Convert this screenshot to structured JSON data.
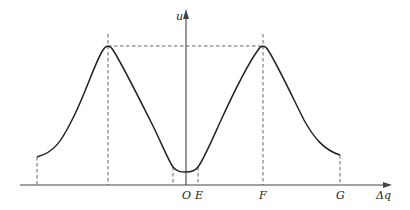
{
  "diagram": {
    "type": "curve-plot",
    "axes": {
      "y_label": "u",
      "x_label": "Δq"
    },
    "point_labels": [
      "O",
      "E",
      "F",
      "G"
    ],
    "colors": {
      "curve": "#222222",
      "axis": "#444444",
      "dashed": "#555555",
      "background": "#ffffff"
    },
    "features": {
      "peaks": 2,
      "minimum_at": "O",
      "dashed_verticals": 6,
      "dashed_horizontal": "connects the two peak maxima"
    }
  }
}
